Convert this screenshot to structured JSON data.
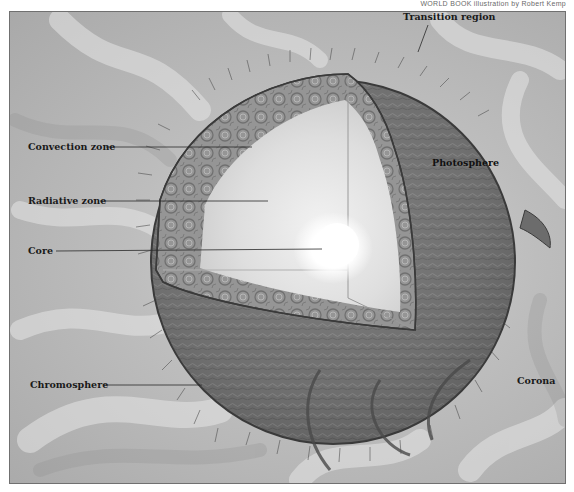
{
  "credit": "WORLD BOOK illustration by Robert Kemp",
  "diagram": {
    "labels": {
      "convection_zone": "Convection zone",
      "radiative_zone": "Radiative zone",
      "core": "Core",
      "transition_region": "Transition region",
      "photosphere": "Photosphere",
      "chromosphere": "Chromosphere",
      "corona": "Corona"
    }
  },
  "colors": {
    "background": "#bdbdbd",
    "sphere_surface": "#6e6e6e",
    "convection_zone": "#8f8f8f",
    "radiative_zone": "#dcdcdc",
    "core": "#ffffff",
    "label_text": "#1a1a1a",
    "pointer_line": "#2a2a2a"
  }
}
